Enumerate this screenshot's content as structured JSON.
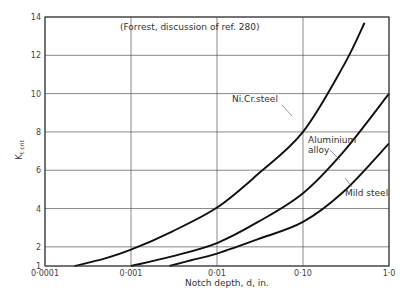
{
  "chart_data": {
    "type": "line",
    "title": "(Forrest, discussion of ref. 280)",
    "xlabel": "Notch depth, d,  in.",
    "ylabel": "Kt crit",
    "xscale": "log",
    "xlim": [
      0.0001,
      1.0
    ],
    "ylim": [
      1,
      14
    ],
    "grid": true,
    "x_tick_labels": [
      "0·0001",
      "0·001",
      "0·01",
      "0·10",
      "1·0"
    ],
    "x_ticks": [
      0.0001,
      0.001,
      0.01,
      0.1,
      1.0
    ],
    "y_tick_labels": [
      "1",
      "2",
      "4",
      "6",
      "8",
      "10",
      "12",
      "14"
    ],
    "y_ticks": [
      1,
      2,
      4,
      6,
      8,
      10,
      12,
      14
    ],
    "series": [
      {
        "name": "Ni.Cr.steel",
        "x": [
          0.00022,
          0.0005,
          0.001,
          0.003,
          0.01,
          0.03,
          0.1,
          0.3,
          0.52
        ],
        "y": [
          1.0,
          1.4,
          1.85,
          2.8,
          4.05,
          5.8,
          8.0,
          11.5,
          13.7
        ]
      },
      {
        "name": "Aluminium alloy",
        "x": [
          0.001,
          0.003,
          0.01,
          0.03,
          0.1,
          0.3,
          1.0
        ],
        "y": [
          1.0,
          1.5,
          2.2,
          3.3,
          4.8,
          7.0,
          10.0
        ]
      },
      {
        "name": "Mild steel",
        "x": [
          0.0028,
          0.005,
          0.01,
          0.03,
          0.1,
          0.3,
          1.0
        ],
        "y": [
          1.0,
          1.3,
          1.65,
          2.4,
          3.3,
          4.9,
          7.4
        ]
      }
    ],
    "annotations": [
      "Ni.Cr.steel",
      "Aluminium",
      "alloy",
      "Mild steel"
    ]
  },
  "text": {
    "title": "(Forrest, discussion of ref. 280)",
    "xlabel": "Notch depth, d,  in.",
    "ylabel_main": "K",
    "ylabel_sub": "t crit",
    "label_nicr": "Ni.Cr.steel",
    "label_al_1": "Aluminium",
    "label_al_2": "alloy",
    "label_mild": "Mild steel"
  }
}
